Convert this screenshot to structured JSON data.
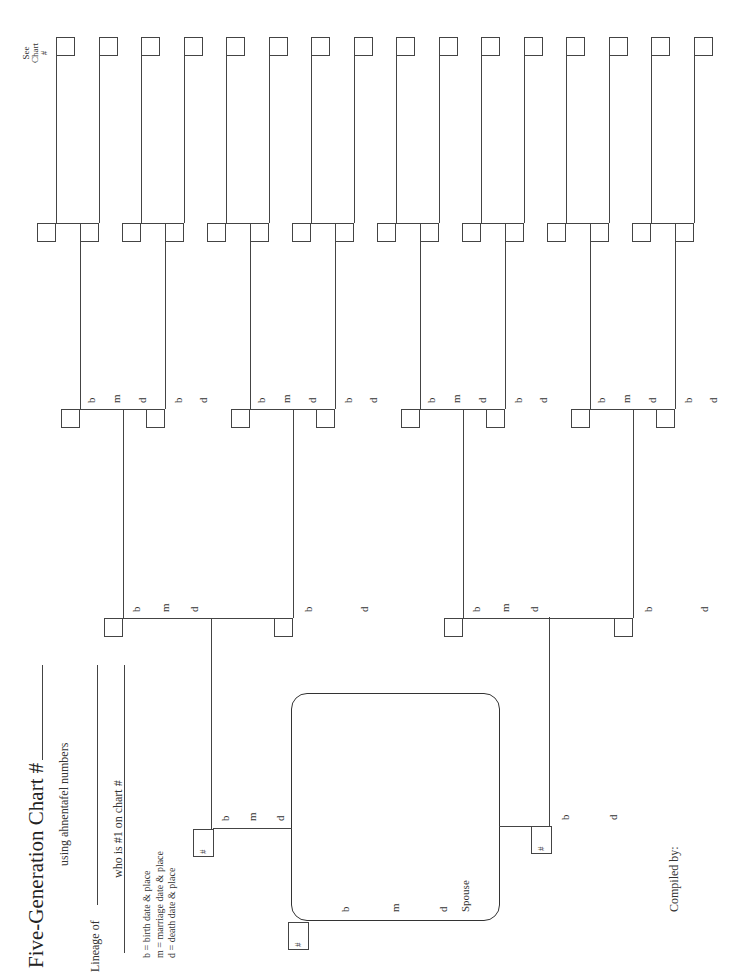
{
  "header": {
    "title": "Five-Generation Chart #",
    "subtitle": "using ahnentafel numbers",
    "lineage_label": "Lineage of",
    "who_label": "who is #1 on chart #"
  },
  "legend": {
    "items": [
      "b = birth date & place",
      "m = marriage date & place",
      "d = death date & place"
    ]
  },
  "see_chart": {
    "line1": "See",
    "line2": "Chart",
    "line3": "#"
  },
  "labels": {
    "birth": "b",
    "marriage": "m",
    "death": "d",
    "number": "#",
    "spouse": "Spouse"
  },
  "footer": {
    "compiled_by": "Compiled by:"
  },
  "generations": {
    "gen1_person": {
      "number": "#",
      "fields": [
        "b",
        "m",
        "d",
        "Spouse"
      ]
    },
    "gen2_parents": [
      {
        "role": "father",
        "number": "#",
        "fields": [
          "b",
          "m",
          "d"
        ]
      },
      {
        "role": "mother",
        "number": "#",
        "fields": [
          "b",
          "d"
        ]
      }
    ],
    "gen3_count": 4,
    "gen4_count": 8,
    "gen5_count": 16,
    "gen6_see_chart_boxes": 16
  }
}
